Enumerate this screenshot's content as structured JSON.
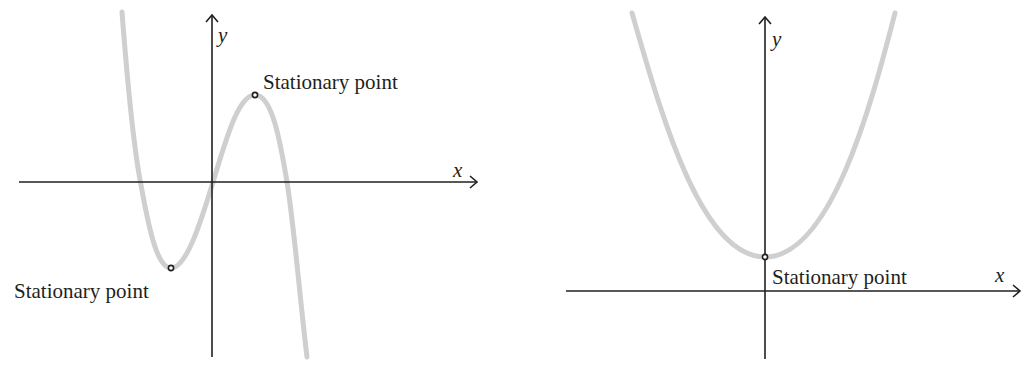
{
  "colors": {
    "axis": "#231f20",
    "curve": "#cfcfcf",
    "point": "#231f20",
    "background": "#ffffff"
  },
  "left_graph": {
    "description": "Cubic curve with a local minimum and a local maximum",
    "x_axis_label": "x",
    "y_axis_label": "y",
    "points": [
      {
        "label": "Stationary point",
        "kind": "maximum"
      },
      {
        "label": "Stationary point",
        "kind": "minimum"
      }
    ]
  },
  "right_graph": {
    "description": "Upward parabola with minimum on the y-axis above the x-axis",
    "x_axis_label": "x",
    "y_axis_label": "y",
    "points": [
      {
        "label": "Stationary point",
        "kind": "minimum"
      }
    ]
  }
}
